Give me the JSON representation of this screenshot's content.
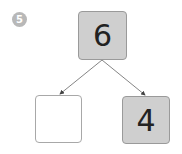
{
  "question": {
    "number": "5"
  },
  "number_bond": {
    "whole": {
      "value": "6",
      "fill": "#cfcfcf"
    },
    "parts": [
      {
        "value": "",
        "fill": "#ffffff"
      },
      {
        "value": "4",
        "fill": "#cfcfcf"
      }
    ]
  }
}
